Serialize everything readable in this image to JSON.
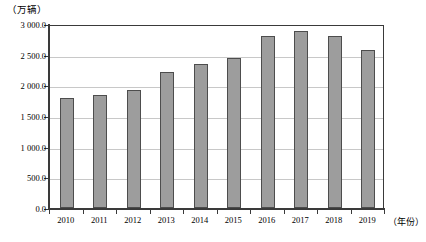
{
  "chart_data": {
    "type": "bar",
    "title": "",
    "xlabel": "（年份）",
    "ylabel": "（万辆）",
    "categories": [
      "2010",
      "2011",
      "2012",
      "2013",
      "2014",
      "2015",
      "2016",
      "2017",
      "2018",
      "2019"
    ],
    "values": [
      1800.0,
      1850.0,
      1930.0,
      2210.0,
      2350.0,
      2450.0,
      2800.0,
      2890.0,
      2800.0,
      2580.0
    ],
    "ylim": [
      0.0,
      3000.0
    ],
    "ytick_labels": [
      "0.0",
      "500.0",
      "1 000.0",
      "1 500.0",
      "2 000.0",
      "2 500.0",
      "3 000.0"
    ],
    "ytick_values": [
      0,
      500,
      1000,
      1500,
      2000,
      2500,
      3000
    ],
    "grid": true,
    "legend": "none",
    "bar_color": "#9d9d9d",
    "bar_border_color": "#4d4d4d",
    "axis_color": "#3a3a3a",
    "grid_color": "#c8c8c8"
  }
}
